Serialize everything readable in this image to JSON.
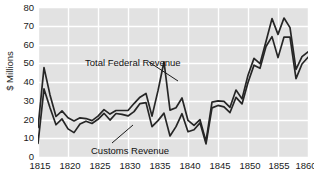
{
  "chart_data": {
    "type": "line",
    "title": "",
    "subtitle": "",
    "xlabel": "",
    "ylabel": "$ Millions",
    "xlim": [
      1815,
      1860
    ],
    "ylim": [
      0,
      80
    ],
    "ytick_step": 10,
    "xtick_step": 5,
    "grid": true,
    "grid_color": "#ffffff",
    "plot_background": "#e2e2e2",
    "line_color": "#262626",
    "legend_position": "in-plot annotations",
    "x_tick_labels": [
      "1815",
      "1820",
      "1825",
      "1830",
      "1835",
      "1840",
      "1845",
      "1850",
      "1855",
      "1860"
    ],
    "y_tick_labels": [
      "0",
      "10",
      "20",
      "30",
      "40",
      "50",
      "60",
      "70",
      "80"
    ],
    "annotations": [
      {
        "id": "total-federal-revenue",
        "text": "Total Federal Revenue",
        "points_to_year": 1836
      },
      {
        "id": "customs-revenue",
        "text": "Customs Revenue",
        "points_to_year": 1831
      }
    ],
    "x": [
      1815,
      1816,
      1817,
      1818,
      1819,
      1820,
      1821,
      1822,
      1823,
      1824,
      1825,
      1826,
      1827,
      1828,
      1829,
      1830,
      1831,
      1832,
      1833,
      1834,
      1835,
      1836,
      1837,
      1838,
      1839,
      1840,
      1841,
      1842,
      1843,
      1844,
      1845,
      1846,
      1847,
      1848,
      1849,
      1850,
      1851,
      1852,
      1853,
      1854,
      1855,
      1856,
      1857,
      1858,
      1859,
      1860
    ],
    "series": [
      {
        "name": "Total Federal Revenue",
        "color": "#262626",
        "values": [
          15.7,
          47.7,
          33.1,
          21.6,
          24.6,
          20.9,
          19.2,
          20.9,
          20.5,
          19.4,
          21.8,
          25.3,
          22.9,
          24.8,
          24.8,
          24.8,
          28.5,
          31.9,
          33.9,
          21.8,
          35.4,
          50.8,
          25.0,
          26.3,
          31.5,
          19.5,
          16.9,
          19.9,
          8.3,
          29.3,
          29.9,
          29.7,
          26.5,
          35.7,
          31.0,
          43.6,
          52.6,
          49.8,
          61.6,
          73.8,
          65.4,
          74.1,
          69.0,
          46.7,
          53.5,
          56.1
        ]
      },
      {
        "name": "Customs Revenue",
        "color": "#262626",
        "values": [
          7.3,
          36.3,
          26.3,
          17.2,
          20.3,
          15.0,
          13.0,
          17.6,
          19.1,
          17.9,
          20.1,
          23.3,
          19.7,
          23.2,
          22.7,
          21.9,
          24.2,
          28.5,
          29.0,
          16.2,
          19.4,
          23.4,
          11.2,
          16.2,
          23.1,
          13.5,
          14.5,
          18.2,
          7.0,
          26.2,
          27.5,
          26.7,
          23.7,
          31.8,
          28.3,
          39.7,
          49.0,
          47.3,
          58.9,
          64.2,
          53.0,
          64.0,
          63.9,
          41.8,
          49.6,
          53.2
        ]
      }
    ]
  },
  "axes": {
    "y_title": "$ Millions"
  },
  "annotations": {
    "total_label": "Total Federal Revenue",
    "customs_label": "Customs Revenue"
  }
}
